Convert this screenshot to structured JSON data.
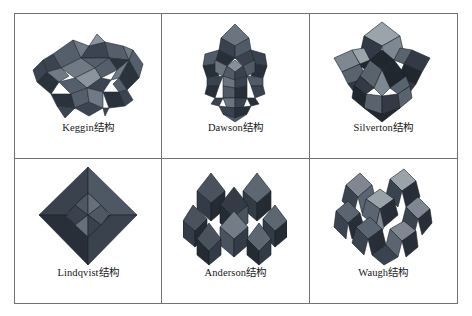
{
  "figure": {
    "kind": "illustration-grid",
    "rows": 2,
    "columns": 3,
    "background_color": "#ffffff",
    "border_color": "#6e7378",
    "caption_color": "#161616"
  },
  "cells": [
    {
      "id": "keggin",
      "name_latin": "Keggin",
      "name_cjk": "结构",
      "caption": "Keggin结构",
      "model": "keggin",
      "palette": {
        "dark": "#3b4450",
        "mid": "#555f6b",
        "light": "#6f7a85",
        "highlight": "#8b949d",
        "shadow": "#2a323c"
      }
    },
    {
      "id": "dawson",
      "name_latin": "Dawson",
      "name_cjk": "结构",
      "caption": "Dawson结构",
      "model": "dawson",
      "palette": {
        "dark": "#39424e",
        "mid": "#515b67",
        "light": "#6b757f",
        "highlight": "#87909a",
        "shadow": "#272f38"
      }
    },
    {
      "id": "silverton",
      "name_latin": "Silverton",
      "name_cjk": "结构",
      "caption": "Silverton结构",
      "model": "silverton",
      "palette": {
        "dark": "#313a45",
        "mid": "#59636e",
        "light": "#7e8892",
        "highlight": "#9ba3ab",
        "shadow": "#20272f"
      }
    },
    {
      "id": "lindqvist",
      "name_latin": "Lindqvist",
      "name_cjk": "结构",
      "caption": "Lindqvist结构",
      "model": "lindqvist",
      "palette": {
        "dark": "#39424d",
        "mid": "#4e5864",
        "light": "#65707b",
        "highlight": "#7c868f",
        "shadow": "#282f38"
      }
    },
    {
      "id": "anderson",
      "name_latin": "Anderson",
      "name_cjk": "结构",
      "caption": "Anderson结构",
      "model": "anderson",
      "palette": {
        "dark": "#333b46",
        "mid": "#49525d",
        "light": "#5d6772",
        "highlight": "#737d87",
        "shadow": "#242b33"
      }
    },
    {
      "id": "waugh",
      "name_latin": "Waugh",
      "name_cjk": "结构",
      "caption": "Waugh结构",
      "model": "waugh",
      "palette": {
        "dark": "#3a434e",
        "mid": "#5b6571",
        "light": "#7f8892",
        "highlight": "#9aa2aa",
        "shadow": "#272e37"
      }
    }
  ]
}
